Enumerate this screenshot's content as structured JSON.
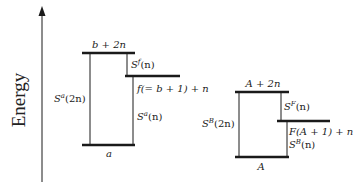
{
  "axis": {
    "title": "Energy",
    "direction": "up"
  },
  "left_diagram": {
    "levels": {
      "top": "b + 2n",
      "middle": "f(= b + 1) + n",
      "bottom": "a"
    },
    "transitions": {
      "long": {
        "base": "S",
        "sup": "a",
        "arg": "(2n)"
      },
      "upper_short": {
        "base": "S",
        "sup": "f",
        "arg": "(n)"
      },
      "lower_short": {
        "base": "S",
        "sup": "a",
        "arg": "(n)"
      }
    }
  },
  "right_diagram": {
    "levels": {
      "top": "A + 2n",
      "middle": "F(A + 1) + n",
      "bottom": "A"
    },
    "transitions": {
      "long": {
        "base": "S",
        "sup": "B",
        "arg": "(2n)"
      },
      "upper_short": {
        "base": "S",
        "sup": "F",
        "arg": "(n)"
      },
      "lower_short": {
        "base": "S",
        "sup": "B",
        "arg": "(n)"
      }
    }
  },
  "colors": {
    "line": "#1a1a1a",
    "text": "#222222",
    "background": "#ffffff"
  }
}
